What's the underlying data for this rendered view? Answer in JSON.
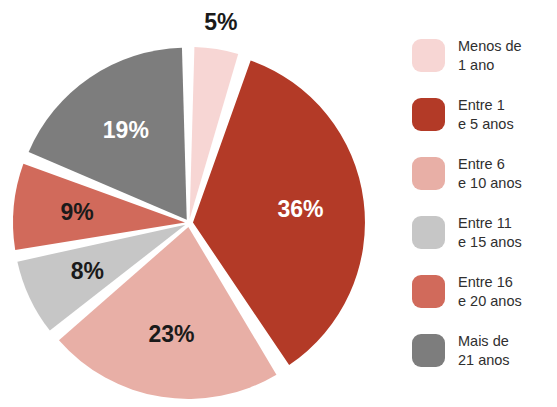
{
  "chart_data": {
    "type": "pie",
    "title": "",
    "xlabel": "",
    "ylabel": "",
    "legend_position": "right",
    "grid": false,
    "units": "percent",
    "start_angle_deg": 0,
    "direction": "clockwise",
    "categories": [
      "Menos de\n1 ano",
      "Entre 1\ne 5 anos",
      "Entre 6\ne 10 anos",
      "Entre 11\ne 15 anos",
      "Entre 16\ne 20 anos",
      "Mais de\n21 anos"
    ],
    "values": [
      5,
      36,
      23,
      8,
      9,
      19
    ],
    "data_labels": [
      "5%",
      "36%",
      "23%",
      "8%",
      "9%",
      "19%"
    ],
    "colors": [
      "#F7D6D4",
      "#B33A27",
      "#E8AFA6",
      "#C6C6C6",
      "#D16A5B",
      "#7D7D7D"
    ],
    "label_colors": [
      "#1a1a1a",
      "#ffffff",
      "#1a1a1a",
      "#1a1a1a",
      "#1a1a1a",
      "#ffffff"
    ],
    "slices": [
      {
        "label": "Menos de\n1 ano",
        "value": 5,
        "data_label": "5%",
        "color": "#F7D6D4",
        "label_color": "#1a1a1a"
      },
      {
        "label": "Entre 1\ne 5 anos",
        "value": 36,
        "data_label": "36%",
        "color": "#B33A27",
        "label_color": "#ffffff"
      },
      {
        "label": "Entre 6\ne 10 anos",
        "value": 23,
        "data_label": "23%",
        "color": "#E8AFA6",
        "label_color": "#1a1a1a"
      },
      {
        "label": "Entre 11\ne 15 anos",
        "value": 8,
        "data_label": "8%",
        "color": "#C6C6C6",
        "label_color": "#1a1a1a"
      },
      {
        "label": "Entre 16\ne 20 anos",
        "value": 9,
        "data_label": "9%",
        "color": "#D16A5B",
        "label_color": "#1a1a1a"
      },
      {
        "label": "Mais de\n21 anos",
        "value": 19,
        "data_label": "19%",
        "color": "#7D7D7D",
        "label_color": "#ffffff"
      }
    ],
    "geometry": {
      "center_x": 189,
      "center_y": 223,
      "radius": 172,
      "gap_deg": 3.2,
      "explode": 4,
      "label_radius_fraction": 0.63
    }
  },
  "legend": {
    "items": [
      {
        "label": "Menos de\n1 ano",
        "color": "#F7D6D4"
      },
      {
        "label": "Entre 1\ne 5 anos",
        "color": "#B33A27"
      },
      {
        "label": "Entre 6\ne 10 anos",
        "color": "#E8AFA6"
      },
      {
        "label": "Entre 11\ne 15 anos",
        "color": "#C6C6C6"
      },
      {
        "label": "Entre 16\ne 20 anos",
        "color": "#D16A5B"
      },
      {
        "label": "Mais de\n21 anos",
        "color": "#7D7D7D"
      }
    ]
  }
}
